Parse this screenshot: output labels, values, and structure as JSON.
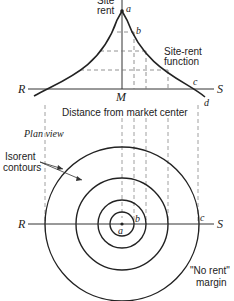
{
  "diagram": {
    "type": "site-rent-function-and-isorent-contours",
    "profile": {
      "y_axis_label_line1": "Site",
      "y_axis_label_line2": "rent",
      "x_axis_caption": "Distance from market center",
      "curve_label_line1": "Site-rent",
      "curve_label_line2": "function",
      "axis_left": "R",
      "axis_right": "S",
      "center": "M",
      "points": {
        "a": "a",
        "b": "b",
        "c": "c",
        "d": "d"
      }
    },
    "plan": {
      "title": "Plan view",
      "contours_label_line1": "Isorent",
      "contours_label_line2": "contours",
      "axis_left": "R",
      "axis_right": "S",
      "points": {
        "a": "a",
        "b": "b",
        "c": "c"
      },
      "margin_label_line1": "\"No rent\"",
      "margin_label_line2": "margin",
      "circle_count": 4
    }
  }
}
